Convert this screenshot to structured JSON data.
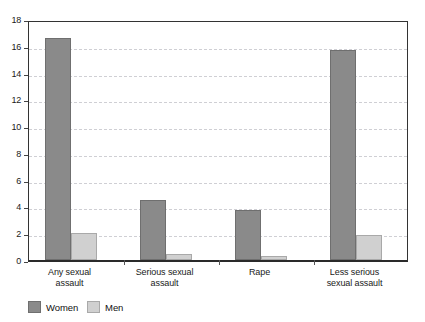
{
  "chart_data": {
    "type": "bar",
    "title": "",
    "subtitle": "",
    "xlabel": "",
    "ylabel": "",
    "ylim": [
      0,
      18
    ],
    "ytick_step": 2,
    "yticks": [
      "0",
      "2",
      "4",
      "6",
      "8",
      "10",
      "12",
      "14",
      "16",
      "18"
    ],
    "grid": true,
    "legend_position": "bottom-left",
    "categories": [
      "Any sexual\nassault",
      "Serious sexual\nassault",
      "Rape",
      "Less serious\nsexual assault"
    ],
    "series": [
      {
        "name": "Women",
        "color": "#8a8a8a",
        "values": [
          16.6,
          4.45,
          3.7,
          15.7
        ]
      },
      {
        "name": "Men",
        "color": "#d0d0d0",
        "values": [
          2.0,
          0.45,
          0.3,
          1.9
        ]
      }
    ]
  },
  "legend": {
    "items": [
      {
        "label": "Women",
        "color": "#8a8a8a"
      },
      {
        "label": "Men",
        "color": "#d0d0d0"
      }
    ]
  },
  "axis": {
    "y_labels": [
      "18",
      "16",
      "14",
      "12",
      "10",
      "8",
      "6",
      "4",
      "2",
      "0"
    ]
  },
  "colors": {
    "women": "#8a8a8a",
    "men": "#d0d0d0",
    "gridline": "#cfcfd4",
    "axis": "#333333",
    "background": "#ffffff",
    "text": "#1a1a1a"
  }
}
